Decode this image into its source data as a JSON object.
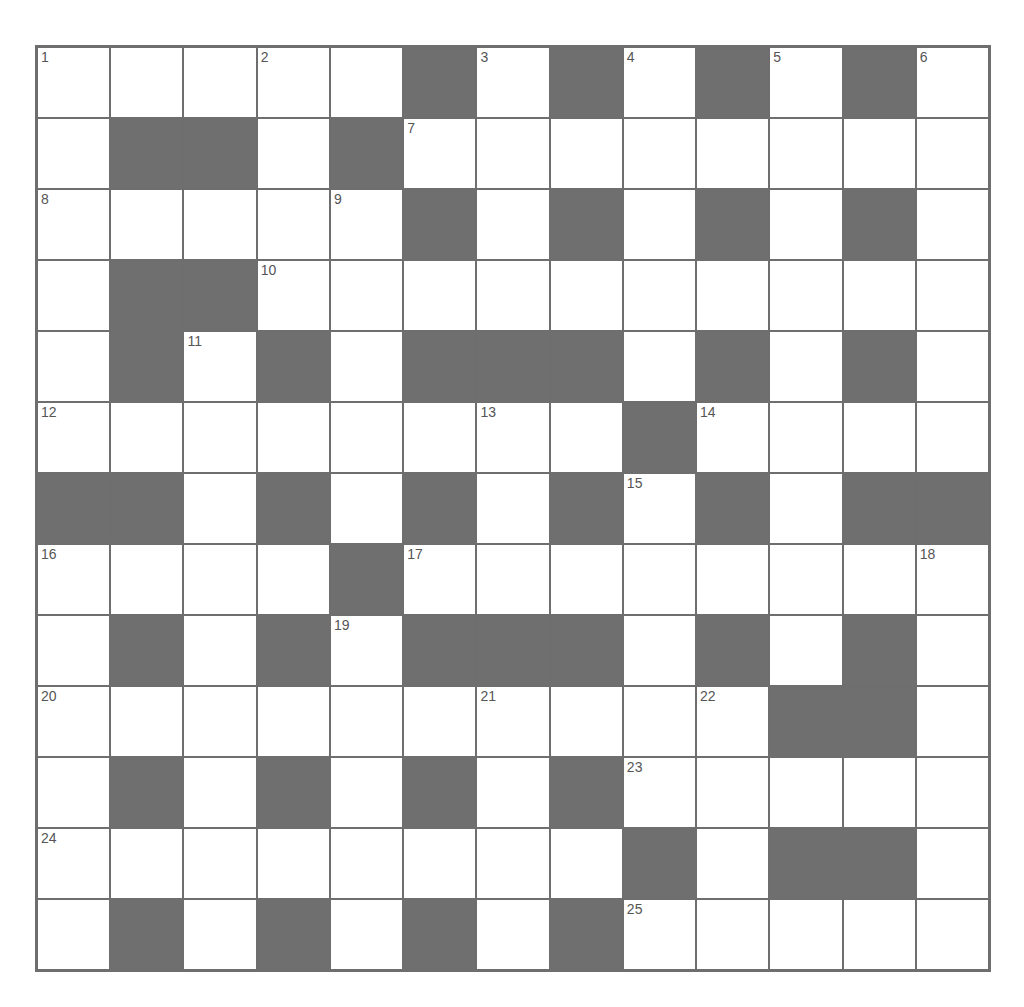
{
  "puzzle": {
    "rows": 13,
    "cols": 13,
    "colors": {
      "block": "#6f6f6f",
      "cell": "#ffffff",
      "border": "#6e6e6e",
      "number": "#555555"
    },
    "grid": [
      "WWWWWBWBWBWBW",
      "WBBWBWWWWWWWW",
      "WWWWWBWBWBWBW",
      "WBBWWWWWWWWWW",
      "WBWBWBBBWBWBW",
      "WWWWWWWWBWWWW",
      "BBWBWBWBWBWBB",
      "WWWWBWWWWWWWW",
      "WBWBWBBBWBWBW",
      "WWWWWWWWWWBBW",
      "WBWBWBWBWWWWW",
      "WWWWWWWWBWBBW",
      "WBWBWBWBWWWWW"
    ],
    "numbers": [
      {
        "row": 0,
        "col": 0,
        "n": "1"
      },
      {
        "row": 0,
        "col": 3,
        "n": "2"
      },
      {
        "row": 0,
        "col": 6,
        "n": "3"
      },
      {
        "row": 0,
        "col": 8,
        "n": "4"
      },
      {
        "row": 0,
        "col": 10,
        "n": "5"
      },
      {
        "row": 0,
        "col": 12,
        "n": "6"
      },
      {
        "row": 1,
        "col": 5,
        "n": "7"
      },
      {
        "row": 2,
        "col": 0,
        "n": "8"
      },
      {
        "row": 2,
        "col": 4,
        "n": "9"
      },
      {
        "row": 3,
        "col": 3,
        "n": "10"
      },
      {
        "row": 4,
        "col": 2,
        "n": "11"
      },
      {
        "row": 5,
        "col": 0,
        "n": "12"
      },
      {
        "row": 5,
        "col": 6,
        "n": "13"
      },
      {
        "row": 5,
        "col": 9,
        "n": "14"
      },
      {
        "row": 6,
        "col": 8,
        "n": "15"
      },
      {
        "row": 7,
        "col": 0,
        "n": "16"
      },
      {
        "row": 7,
        "col": 5,
        "n": "17"
      },
      {
        "row": 7,
        "col": 12,
        "n": "18"
      },
      {
        "row": 8,
        "col": 4,
        "n": "19"
      },
      {
        "row": 9,
        "col": 0,
        "n": "20"
      },
      {
        "row": 9,
        "col": 6,
        "n": "21"
      },
      {
        "row": 9,
        "col": 9,
        "n": "22"
      },
      {
        "row": 10,
        "col": 8,
        "n": "23"
      },
      {
        "row": 11,
        "col": 0,
        "n": "24"
      },
      {
        "row": 12,
        "col": 8,
        "n": "25"
      }
    ]
  }
}
